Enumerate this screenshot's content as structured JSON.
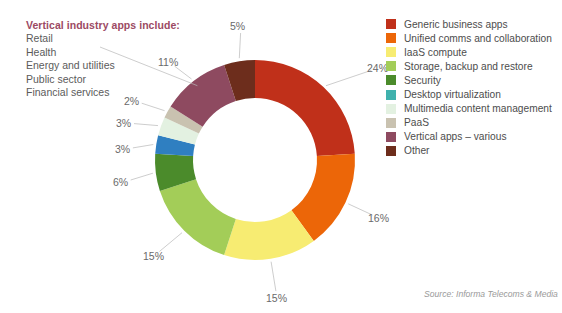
{
  "annotation": {
    "title": "Vertical industry apps include:",
    "items": [
      "Retail",
      "Health",
      "Energy and utilities",
      "Public sector",
      "Financial services"
    ],
    "title_color": "#9c4a63",
    "item_color": "#5b5b5b"
  },
  "source": {
    "text": "Source: Informa Telecoms & Media"
  },
  "legend": {
    "entries": [
      {
        "label": "Generic business apps",
        "color": "#c0301a"
      },
      {
        "label": "Unified comms and collaboration",
        "color": "#ec6608"
      },
      {
        "label": "IaaS compute",
        "color": "#f7ec72"
      },
      {
        "label": "Storage, backup and restore",
        "color": "#a3cd58"
      },
      {
        "label": "Security",
        "color": "#4b8b2b"
      },
      {
        "label": "Desktop virtualization",
        "color": "#3fb1ad"
      },
      {
        "label": "Multimedia content management",
        "color": "#e3f1e1"
      },
      {
        "label": "PaaS",
        "color": "#c9c2b0"
      },
      {
        "label": "Vertical apps – various",
        "color": "#8e4a60"
      },
      {
        "label": "Other",
        "color": "#6d2d1c"
      }
    ]
  },
  "chart_data": {
    "type": "pie",
    "variant": "donut",
    "title": "",
    "xlabel": "",
    "ylabel": "",
    "unit": "%",
    "start_angle_deg": 0,
    "direction": "clockwise",
    "center": {
      "x": 255,
      "y": 160
    },
    "outer_radius": 100,
    "inner_radius": 62,
    "categories": [
      "Generic business apps",
      "Unified comms and collaboration",
      "IaaS compute",
      "Storage, backup and restore",
      "Security",
      "Desktop virtualization",
      "Multimedia content management",
      "PaaS",
      "Vertical apps – various",
      "Other"
    ],
    "values": [
      24,
      16,
      15,
      15,
      6,
      3,
      3,
      2,
      11,
      5
    ],
    "labels": [
      "24%",
      "16%",
      "15%",
      "15%",
      "6%",
      "3%",
      "3%",
      "2%",
      "11%",
      "5%"
    ],
    "colors": [
      "#c0301a",
      "#ec6608",
      "#f7ec72",
      "#a3cd58",
      "#4b8b2b",
      "#2f7fc1",
      "#e3f1e1",
      "#c9c2b0",
      "#8e4a60",
      "#6d2d1c"
    ],
    "legend_position": "right",
    "grid": false
  },
  "callouts": [
    {
      "text": "24%",
      "x": 367,
      "y": 62
    },
    {
      "text": "16%",
      "x": 368,
      "y": 212
    },
    {
      "text": "15%",
      "x": 266,
      "y": 292
    },
    {
      "text": "15%",
      "x": 143,
      "y": 250
    },
    {
      "text": "6%",
      "x": 113,
      "y": 176
    },
    {
      "text": "3%",
      "x": 115,
      "y": 143
    },
    {
      "text": "3%",
      "x": 116,
      "y": 117
    },
    {
      "text": "2%",
      "x": 124,
      "y": 95
    },
    {
      "text": "11%",
      "x": 158,
      "y": 56
    },
    {
      "text": "5%",
      "x": 230,
      "y": 20
    }
  ]
}
